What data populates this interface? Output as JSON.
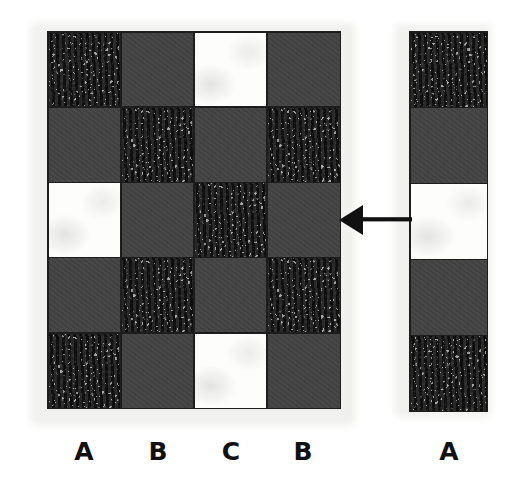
{
  "figure": {
    "background_color": "#ffffff",
    "paper_halo_color": "#f1f1ef"
  },
  "palette": {
    "dark_gray": "#434343",
    "texture_light": "#9d9d99",
    "texture_dark": "#3c3c3c",
    "white": "#fdfdfb",
    "ink_black": "#1d1d1d",
    "label_color": "#111111"
  },
  "main_grid": {
    "name": "main-checkerboard",
    "columns": 4,
    "rows": 5,
    "cell_types": [
      "textured",
      "dark",
      "white"
    ],
    "cells": [
      [
        "textured",
        "dark",
        "white",
        "dark"
      ],
      [
        "dark",
        "textured",
        "dark",
        "textured"
      ],
      [
        "white",
        "dark",
        "textured",
        "dark"
      ],
      [
        "dark",
        "textured",
        "dark",
        "textured"
      ],
      [
        "textured",
        "dark",
        "white",
        "dark"
      ]
    ],
    "column_labels": [
      "A",
      "B",
      "C",
      "B"
    ]
  },
  "side_column": {
    "name": "reference-column",
    "columns": 1,
    "rows": 5,
    "cells": [
      [
        "textured"
      ],
      [
        "dark"
      ],
      [
        "white"
      ],
      [
        "dark"
      ],
      [
        "textured"
      ]
    ],
    "column_labels": [
      "A"
    ]
  },
  "arrow": {
    "name": "transfer-arrow",
    "direction": "left",
    "color": "#111111",
    "from": "reference-column",
    "to": "main-checkerboard-row-3"
  }
}
